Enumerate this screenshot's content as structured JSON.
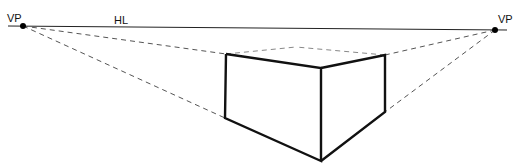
{
  "diagram": {
    "labels": {
      "vp_left": "VP",
      "vp_right": "VP",
      "horizon": "HL"
    },
    "colors": {
      "ink": "#111111",
      "guide": "#555555",
      "background": "#ffffff"
    },
    "points": {
      "vp_left": [
        23,
        26
      ],
      "vp_right": [
        495,
        30
      ],
      "box_top_left": [
        226,
        54
      ],
      "box_bottom_left": [
        225,
        118
      ],
      "box_top_front": [
        321,
        68
      ],
      "box_bottom_front": [
        321,
        161
      ],
      "box_top_right": [
        385,
        55
      ],
      "box_bottom_right": [
        385,
        112
      ],
      "box_top_back": [
        296,
        47
      ]
    }
  }
}
